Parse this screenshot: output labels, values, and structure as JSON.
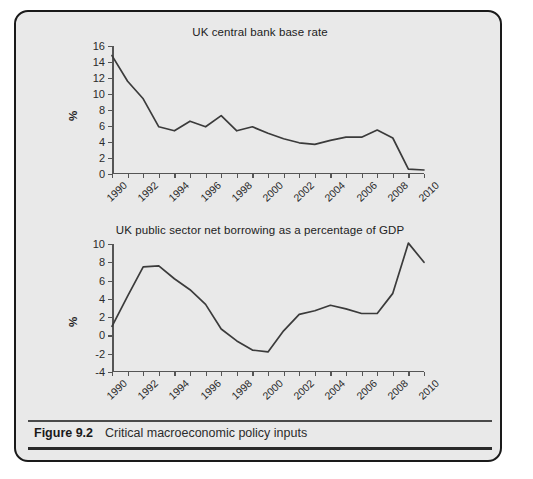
{
  "figure": {
    "caption_label": "Figure 9.2",
    "caption_title": "Critical macroeconomic policy inputs",
    "panel_background": "#e9e9e9",
    "border_color": "#1a1a1a",
    "line_color": "#3b3b3b"
  },
  "chart_data": [
    {
      "type": "line",
      "title": "UK central bank base rate",
      "xlabel": "",
      "ylabel": "%",
      "ylim": [
        0,
        16
      ],
      "ytick_step": 2,
      "yticks": [
        0,
        2,
        4,
        6,
        8,
        10,
        12,
        14,
        16
      ],
      "xlim": [
        1990,
        2010
      ],
      "xticks": [
        1990,
        1991,
        1992,
        1993,
        1994,
        1995,
        1996,
        1997,
        1998,
        1999,
        2000,
        2001,
        2002,
        2003,
        2004,
        2005,
        2006,
        2007,
        2008,
        2009,
        2010
      ],
      "xtick_labels": [
        "1990",
        "",
        "1992",
        "",
        "1994",
        "",
        "1996",
        "",
        "1998",
        "",
        "2000",
        "",
        "2002",
        "",
        "2004",
        "",
        "2006",
        "",
        "2008",
        "",
        "2010"
      ],
      "grid": false,
      "legend": "none",
      "x": [
        1990,
        1991,
        1992,
        1993,
        1994,
        1995,
        1996,
        1997,
        1998,
        1999,
        2000,
        2001,
        2002,
        2003,
        2004,
        2005,
        2006,
        2007,
        2008,
        2009,
        2010
      ],
      "values": [
        14.8,
        11.6,
        9.4,
        5.9,
        5.4,
        6.6,
        5.9,
        7.3,
        5.4,
        5.9,
        5.1,
        4.4,
        3.9,
        3.7,
        4.2,
        4.6,
        4.6,
        5.5,
        4.5,
        0.6,
        0.5
      ]
    },
    {
      "type": "line",
      "title": "UK public sector net borrowing as a percentage of GDP",
      "xlabel": "",
      "ylabel": "%",
      "ylim": [
        -4,
        10
      ],
      "ytick_step": 2,
      "yticks": [
        -4,
        -2,
        0,
        2,
        4,
        6,
        8,
        10
      ],
      "xlim": [
        1990,
        2010
      ],
      "xticks": [
        1990,
        1991,
        1992,
        1993,
        1994,
        1995,
        1996,
        1997,
        1998,
        1999,
        2000,
        2001,
        2002,
        2003,
        2004,
        2005,
        2006,
        2007,
        2008,
        2009,
        2010
      ],
      "xtick_labels": [
        "1990",
        "",
        "1992",
        "",
        "1994",
        "",
        "1996",
        "",
        "1998",
        "",
        "2000",
        "",
        "2002",
        "",
        "2004",
        "",
        "2006",
        "",
        "2008",
        "",
        "2010"
      ],
      "grid": false,
      "legend": "none",
      "x": [
        1990,
        1991,
        1992,
        1993,
        1994,
        1995,
        1996,
        1997,
        1998,
        1999,
        2000,
        2001,
        2002,
        2003,
        2004,
        2005,
        2006,
        2007,
        2008,
        2009,
        2010
      ],
      "values": [
        1.0,
        4.3,
        7.5,
        7.6,
        6.2,
        5.0,
        3.4,
        0.7,
        -0.6,
        -1.6,
        -1.8,
        0.5,
        2.3,
        2.7,
        3.3,
        2.9,
        2.4,
        2.4,
        4.6,
        10.1,
        8.0
      ]
    }
  ]
}
